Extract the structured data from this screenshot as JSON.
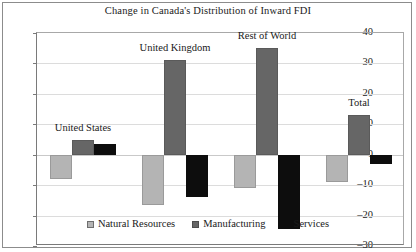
{
  "chart_data": {
    "type": "bar",
    "title": "Change in Canada's Distribution of Inward FDI",
    "xlabel": "",
    "ylabel": "",
    "ylim": [
      -30,
      40
    ],
    "yticks": [
      40,
      30,
      20,
      10,
      0,
      -10,
      -20,
      -30
    ],
    "ytick_labels": [
      "40",
      "30",
      "20",
      "10",
      "0",
      "–10",
      "–20",
      "–30"
    ],
    "grid": true,
    "legend_position": "bottom-center",
    "categories": [
      "United States",
      "United Kingdom",
      "Rest of World",
      "Total"
    ],
    "series": [
      {
        "name": "Natural Resources",
        "color": "#b4b4b4",
        "values": [
          -8,
          -16.5,
          -11,
          -9
        ]
      },
      {
        "name": "Manufacturing",
        "color": "#666666",
        "values": [
          5,
          31,
          35,
          13
        ]
      },
      {
        "name": "Services",
        "color": "#0d0d0d",
        "values": [
          3.5,
          -14,
          -24.5,
          -3
        ]
      }
    ]
  },
  "legend": {
    "items": [
      {
        "label": "Natural Resources"
      },
      {
        "label": "Manufacturing"
      },
      {
        "label": "Services"
      }
    ]
  }
}
